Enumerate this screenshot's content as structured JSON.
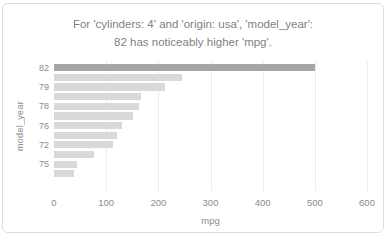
{
  "chart_data": {
    "type": "bar",
    "orientation": "horizontal",
    "title": "For 'cylinders: 4' and 'origin: usa', 'model_year': 82 has noticeably higher 'mpg'.",
    "title_lines": [
      "For 'cylinders: 4' and 'origin: usa', 'model_year':",
      "82 has noticeably higher 'mpg'."
    ],
    "xlabel": "mpg",
    "ylabel": "model_year",
    "xlim": [
      0,
      600
    ],
    "xticks": [
      0,
      100,
      200,
      300,
      400,
      500,
      600
    ],
    "grid": "vertical-on",
    "legend": "none",
    "categories": [
      "82",
      "",
      "79",
      "",
      "78",
      "",
      "76",
      "",
      "72",
      "",
      "75",
      ""
    ],
    "values": [
      500,
      245,
      213,
      166,
      163,
      152,
      130,
      120,
      113,
      77,
      45,
      38
    ],
    "highlight_index": 0,
    "colors": {
      "highlight_bar": "#a6a6a6",
      "bar": "#d9d9d9",
      "title_text": "#7f7f7f",
      "axis_text": "#8c8c8c",
      "gridline": "#ededed",
      "card_border": "#dedede"
    }
  }
}
